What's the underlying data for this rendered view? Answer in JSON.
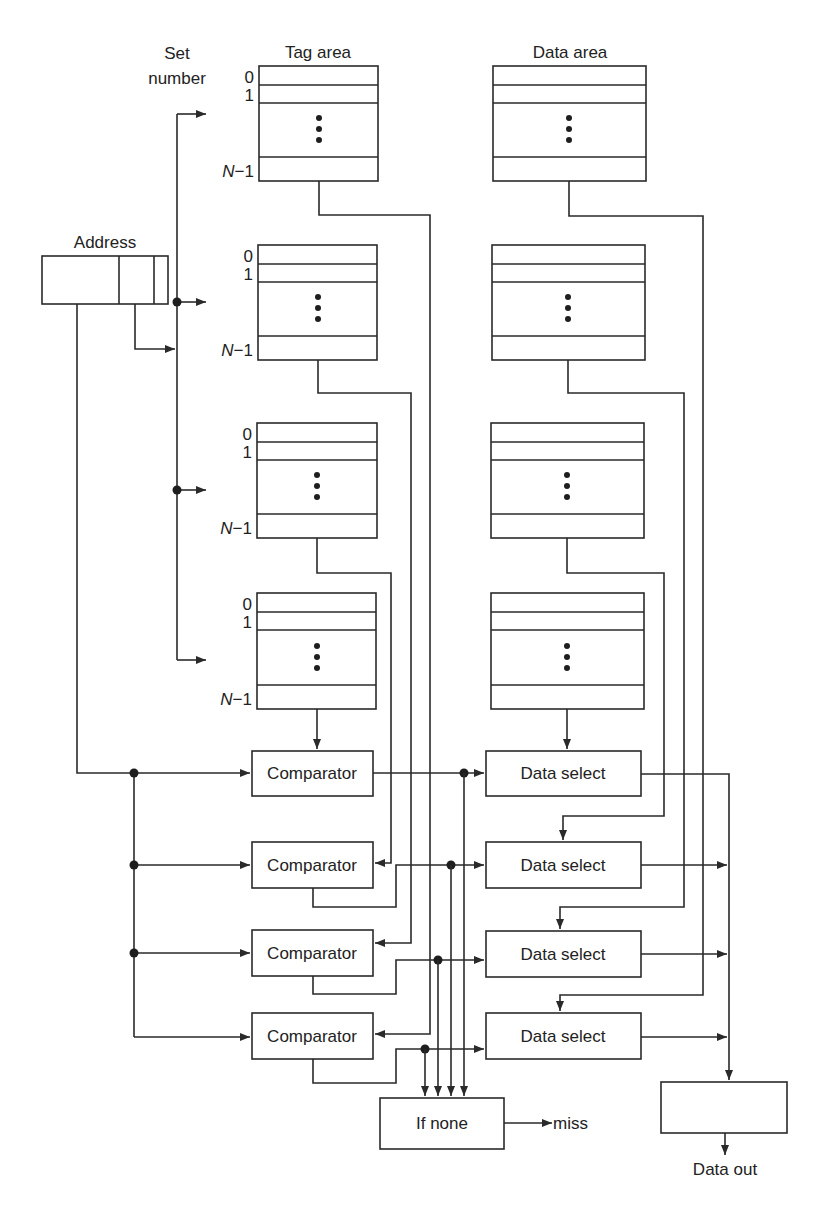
{
  "labels": {
    "set_number_line1": "Set",
    "set_number_line2": "number",
    "tag_area": "Tag area",
    "data_area": "Data area",
    "address": "Address",
    "miss": "miss",
    "data_out": "Data out"
  },
  "row_indices": {
    "first": "0",
    "second": "1",
    "last_n": "N",
    "last_rest": "−1",
    "ellipsis": "⋮"
  },
  "ways": [
    {
      "tag_box": {
        "x": 259,
        "y": 66,
        "w": 119,
        "h": 115
      },
      "data_box": {
        "x": 493,
        "y": 66,
        "w": 153,
        "h": 115
      }
    },
    {
      "tag_box": {
        "x": 258,
        "y": 245,
        "w": 119,
        "h": 115
      },
      "data_box": {
        "x": 492,
        "y": 245,
        "w": 153,
        "h": 115
      }
    },
    {
      "tag_box": {
        "x": 257,
        "y": 423,
        "w": 120,
        "h": 115
      },
      "data_box": {
        "x": 491,
        "y": 423,
        "w": 153,
        "h": 115
      }
    },
    {
      "tag_box": {
        "x": 257,
        "y": 593,
        "w": 119,
        "h": 116
      },
      "data_box": {
        "x": 491,
        "y": 593,
        "w": 153,
        "h": 116
      }
    }
  ],
  "comparators": [
    {
      "label": "Comparator",
      "y": 751
    },
    {
      "label": "Comparator",
      "y": 842
    },
    {
      "label": "Comparator",
      "y": 930
    },
    {
      "label": "Comparator",
      "y": 1013
    }
  ],
  "data_selects": [
    {
      "label": "Data select",
      "y": 751
    },
    {
      "label": "Data select",
      "y": 842
    },
    {
      "label": "Data select",
      "y": 931
    },
    {
      "label": "Data select",
      "y": 1013
    }
  ],
  "if_none": {
    "label": "If none"
  },
  "output_box": {
    "label": ""
  },
  "colors": {
    "line": "#2a2a2a",
    "background": "#ffffff"
  }
}
